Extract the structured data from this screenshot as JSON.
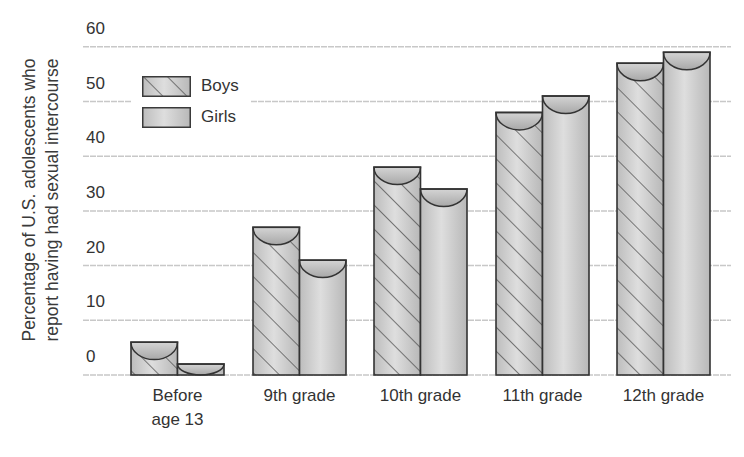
{
  "chart_data": {
    "type": "bar",
    "title": "",
    "xlabel": "",
    "ylabel": "Percentage of U.S. adolescents who report having had sexual intercourse",
    "ylabel_lines": [
      "Percentage of U.S. adolescents who",
      "report having had sexual intercourse"
    ],
    "categories": [
      "Before\nage 13",
      "9th grade",
      "10th grade",
      "11th grade",
      "12th grade"
    ],
    "series": [
      {
        "name": "Boys",
        "values": [
          6,
          27,
          38,
          48,
          57
        ],
        "pattern": "diagonal-hatch"
      },
      {
        "name": "Girls",
        "values": [
          2,
          21,
          34,
          51,
          59
        ],
        "pattern": "solid"
      }
    ],
    "yticks": [
      0,
      10,
      20,
      30,
      40,
      50,
      60
    ],
    "ylim": [
      0,
      60
    ],
    "grid": true,
    "legend_position": "upper-left"
  },
  "colors": {
    "bar_fill_light": "#dcdcdc",
    "bar_fill_dark": "#b4b4b4",
    "bar_outline": "#333333",
    "hatch": "#4a4a4a",
    "gridline": "#c8c8c8",
    "text": "#333333"
  }
}
